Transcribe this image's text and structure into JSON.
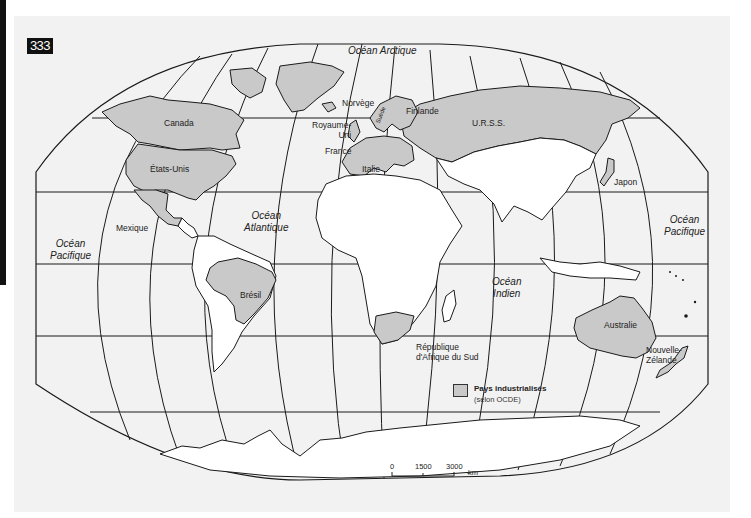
{
  "page": {
    "number_badge": "333"
  },
  "map": {
    "title": "",
    "colors": {
      "paper": "#f2f2f2",
      "ocean": "#f2f2f2",
      "land": "#ffffff",
      "industrialized": "#c9c9c9",
      "outline": "#1a1a1a",
      "badge_bg": "#111111"
    },
    "oceans": [
      {
        "id": "arctic",
        "label": "Océan Arctique"
      },
      {
        "id": "atlantic",
        "line1": "Océan",
        "line2": "Atlantique"
      },
      {
        "id": "pacific_west",
        "line1": "Océan",
        "line2": "Pacifique"
      },
      {
        "id": "pacific_east",
        "line1": "Océan",
        "line2": "Pacifique"
      },
      {
        "id": "indian",
        "line1": "Océan",
        "line2": "Indien"
      }
    ],
    "countries": [
      {
        "id": "canada",
        "label": "Canada",
        "industrialized": true
      },
      {
        "id": "usa",
        "label": "États-Unis",
        "industrialized": true
      },
      {
        "id": "mexico",
        "label": "Mexique",
        "industrialized": false
      },
      {
        "id": "brazil",
        "label": "Brésil",
        "industrialized": false
      },
      {
        "id": "norway",
        "label": "Norvège",
        "industrialized": true
      },
      {
        "id": "sweden",
        "label": "Suède",
        "industrialized": true
      },
      {
        "id": "finland",
        "label": "Finlande",
        "industrialized": true
      },
      {
        "id": "uk",
        "line1": "Royaume-",
        "line2": "Uni",
        "industrialized": true
      },
      {
        "id": "france",
        "label": "France",
        "industrialized": true
      },
      {
        "id": "italy",
        "label": "Italie",
        "industrialized": true
      },
      {
        "id": "ussr",
        "label": "U.R.S.S.",
        "industrialized": true
      },
      {
        "id": "japan",
        "label": "Japon",
        "industrialized": true
      },
      {
        "id": "australia",
        "label": "Australie",
        "industrialized": true
      },
      {
        "id": "new_zealand",
        "line1": "Nouvelle-",
        "line2": "Zélande",
        "industrialized": true
      },
      {
        "id": "south_africa",
        "line1": "République",
        "line2": "d'Afrique du Sud",
        "industrialized": true
      }
    ],
    "legend": {
      "label": "Pays industrialisés",
      "sublabel": "(selon OCDE)"
    },
    "scale_bar": {
      "ticks": [
        "0",
        "1500",
        "3000"
      ],
      "unit": "km"
    }
  }
}
